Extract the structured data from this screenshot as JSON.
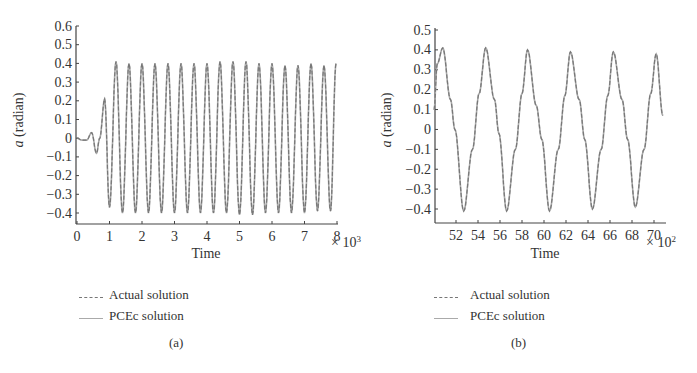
{
  "colors": {
    "axis": "#444444",
    "actual": "#777777",
    "pcec": "#aaaaaa",
    "text": "#333333"
  },
  "chart_data": [
    {
      "id": "a",
      "type": "line",
      "caption": "(a)",
      "title": "",
      "xlabel": "Time",
      "ylabel": "a (radian)",
      "ylabel_italic": "a",
      "ylabel_rest": " (radian)",
      "x_multiplier": "× 10",
      "x_multiplier_exp": "3",
      "xlim": [
        0,
        8
      ],
      "ylim": [
        -0.45,
        0.6
      ],
      "xticks": [
        0,
        1,
        2,
        3,
        4,
        5,
        6,
        7,
        8
      ],
      "xtick_labels": [
        "0",
        "1",
        "2",
        "3",
        "4",
        "5",
        "6",
        "7",
        "8"
      ],
      "yticks": [
        0.6,
        0.5,
        0.4,
        0.3,
        0.2,
        0.1,
        0,
        -0.1,
        -0.2,
        -0.3,
        -0.4
      ],
      "ytick_labels": [
        "0.6",
        "0.5",
        "0.4",
        "0.3",
        "0.2",
        "0.1",
        "0",
        "−0.1",
        "−0.2",
        "−0.3",
        "−0.4"
      ],
      "grid": false,
      "legend_position": "below",
      "series": [
        {
          "name": "Actual solution",
          "style": "dashed"
        },
        {
          "name": "PCEc solution",
          "style": "solid"
        }
      ],
      "x": [
        0,
        0.15,
        0.3,
        0.45,
        0.6,
        0.7,
        0.85,
        1.0,
        1.2,
        1.4,
        1.6,
        1.8,
        2.0,
        2.2,
        2.4,
        2.6,
        2.8,
        3.0,
        3.2,
        3.4,
        3.6,
        3.8,
        4.0,
        4.2,
        4.4,
        4.6,
        4.8,
        5.0,
        5.2,
        5.4,
        5.6,
        5.8,
        6.0,
        6.2,
        6.4,
        6.6,
        6.8,
        7.0,
        7.2,
        7.4,
        7.6,
        7.8,
        7.97
      ],
      "values": [
        0,
        -0.01,
        -0.01,
        0.03,
        -0.08,
        0.0,
        0.21,
        -0.37,
        0.41,
        -0.4,
        0.4,
        -0.4,
        0.4,
        -0.4,
        0.4,
        -0.4,
        0.4,
        -0.4,
        0.4,
        -0.4,
        0.4,
        -0.4,
        0.4,
        -0.4,
        0.41,
        -0.4,
        0.41,
        -0.41,
        0.41,
        -0.41,
        0.4,
        -0.4,
        0.4,
        -0.4,
        0.39,
        -0.4,
        0.39,
        -0.4,
        0.4,
        -0.39,
        0.39,
        -0.39,
        0.4
      ]
    },
    {
      "id": "b",
      "type": "line",
      "caption": "(b)",
      "title": "",
      "xlabel": "Time",
      "ylabel": "a (radian)",
      "ylabel_italic": "a",
      "ylabel_rest": " (radian)",
      "x_multiplier": "× 10",
      "x_multiplier_exp": "2",
      "xlim": [
        50,
        71
      ],
      "ylim": [
        -0.47,
        0.52
      ],
      "xticks": [
        52,
        54,
        56,
        58,
        60,
        62,
        64,
        66,
        68,
        70
      ],
      "xtick_labels": [
        "52",
        "54",
        "56",
        "58",
        "60",
        "62",
        "64",
        "66",
        "68",
        "70"
      ],
      "yticks": [
        0.5,
        0.4,
        0.3,
        0.2,
        0.1,
        0,
        -0.1,
        -0.2,
        -0.3,
        -0.4
      ],
      "ytick_labels": [
        "0.5",
        "0.4",
        "0.3",
        "0.2",
        "0.1",
        "0",
        "−0.1",
        "−0.2",
        "−0.3",
        "−0.4"
      ],
      "grid": false,
      "legend_position": "below",
      "series": [
        {
          "name": "Actual solution",
          "style": "dashed"
        },
        {
          "name": "PCEc solution",
          "style": "solid"
        }
      ],
      "x": [
        50.0,
        50.3,
        50.8,
        51.5,
        51.9,
        52.7,
        53.5,
        54.1,
        54.7,
        55.5,
        55.9,
        56.6,
        57.4,
        58.0,
        58.5,
        59.3,
        59.8,
        60.5,
        61.3,
        61.9,
        62.4,
        63.2,
        63.7,
        64.4,
        65.2,
        65.8,
        66.3,
        67.1,
        67.6,
        68.3,
        69.1,
        69.7,
        70.2,
        70.8
      ],
      "values": [
        0.1,
        0.33,
        0.41,
        0.15,
        0.0,
        -0.41,
        -0.1,
        0.18,
        0.41,
        0.15,
        -0.02,
        -0.41,
        -0.1,
        0.18,
        0.4,
        0.12,
        -0.05,
        -0.41,
        -0.1,
        0.17,
        0.39,
        0.15,
        -0.05,
        -0.4,
        -0.1,
        0.17,
        0.39,
        0.15,
        -0.05,
        -0.39,
        -0.1,
        0.18,
        0.38,
        0.07
      ]
    }
  ],
  "charts": {
    "a": {
      "legend": {
        "actual": "Actual solution",
        "pcec": "PCEc solution"
      },
      "caption": "(a)"
    },
    "b": {
      "legend": {
        "actual": "Actual solution",
        "pcec": "PCEc solution"
      },
      "caption": "(b)"
    }
  }
}
